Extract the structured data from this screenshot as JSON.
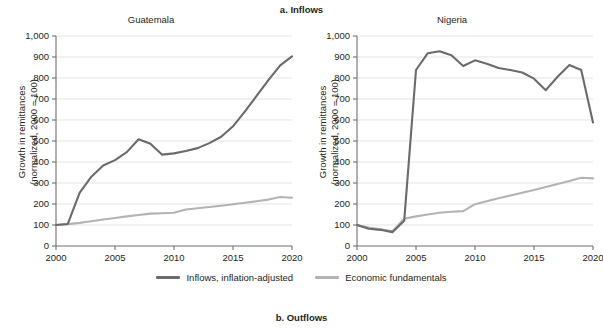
{
  "figure": {
    "panel_a_title": "a. Inflows",
    "panel_b_title": "b. Outflows",
    "legend": [
      {
        "label": "Inflows, inflation-adjusted",
        "color": "#6b6b6b",
        "icon": "line-swatch-icon"
      },
      {
        "label": "Economic fundamentals",
        "color": "#b3b3b3",
        "icon": "line-swatch-icon"
      }
    ]
  },
  "chart_data": [
    {
      "type": "line",
      "title": "Guatemala",
      "xlabel": "",
      "ylabel": "Growth in remittances\n(normalized, 2000 = 100)",
      "xlim": [
        2000,
        2020
      ],
      "ylim": [
        0,
        1000
      ],
      "xticks": [
        2000,
        2005,
        2010,
        2015,
        2020
      ],
      "xtick_labels": [
        "2000",
        "2005",
        "2010",
        "2015",
        "2020"
      ],
      "yticks": [
        0,
        100,
        200,
        300,
        400,
        500,
        600,
        700,
        800,
        900,
        1000
      ],
      "ytick_labels": [
        "0",
        "100",
        "200",
        "300",
        "400",
        "500",
        "600",
        "700",
        "800",
        "900",
        "1,000"
      ],
      "grid": true,
      "legend_position": "below-figure",
      "x": [
        2000,
        2001,
        2002,
        2003,
        2004,
        2005,
        2006,
        2007,
        2008,
        2009,
        2010,
        2011,
        2012,
        2013,
        2014,
        2015,
        2016,
        2017,
        2018,
        2019,
        2020
      ],
      "series": [
        {
          "name": "Inflows, inflation-adjusted",
          "color": "#6b6b6b",
          "values": [
            100,
            105,
            253,
            330,
            383,
            409,
            447,
            508,
            487,
            435,
            441,
            452,
            466,
            490,
            520,
            570,
            640,
            715,
            790,
            860,
            903
          ]
        },
        {
          "name": "Economic fundamentals",
          "color": "#b3b3b3",
          "values": [
            100,
            104,
            110,
            118,
            126,
            133,
            141,
            148,
            154,
            156,
            158,
            174,
            180,
            186,
            192,
            199,
            206,
            213,
            221,
            233,
            230
          ]
        }
      ]
    },
    {
      "type": "line",
      "title": "Nigeria",
      "xlabel": "",
      "ylabel": "Growth in remittances\n(normalized, 2000 = 100)",
      "xlim": [
        2000,
        2020
      ],
      "ylim": [
        0,
        1000
      ],
      "xticks": [
        2000,
        2005,
        2010,
        2015,
        2020
      ],
      "xtick_labels": [
        "2000",
        "2005",
        "2010",
        "2015",
        "2020"
      ],
      "yticks": [
        0,
        100,
        200,
        300,
        400,
        500,
        600,
        700,
        800,
        900,
        1000
      ],
      "ytick_labels": [
        "0",
        "100",
        "200",
        "300",
        "400",
        "500",
        "600",
        "700",
        "800",
        "900",
        "1,000"
      ],
      "grid": true,
      "legend_position": "below-figure",
      "x": [
        2000,
        2001,
        2002,
        2003,
        2004,
        2005,
        2006,
        2007,
        2008,
        2009,
        2010,
        2011,
        2012,
        2013,
        2014,
        2015,
        2016,
        2017,
        2018,
        2019,
        2020
      ],
      "series": [
        {
          "name": "Inflows, inflation-adjusted",
          "color": "#6b6b6b",
          "values": [
            100,
            82,
            77,
            66,
            120,
            838,
            918,
            927,
            908,
            857,
            884,
            868,
            848,
            838,
            826,
            797,
            742,
            806,
            862,
            838,
            588
          ]
        },
        {
          "name": "Economic fundamentals",
          "color": "#b3b3b3",
          "values": [
            100,
            88,
            80,
            70,
            130,
            141,
            150,
            158,
            163,
            166,
            199,
            213,
            227,
            240,
            254,
            267,
            281,
            295,
            310,
            325,
            322
          ]
        }
      ]
    }
  ]
}
